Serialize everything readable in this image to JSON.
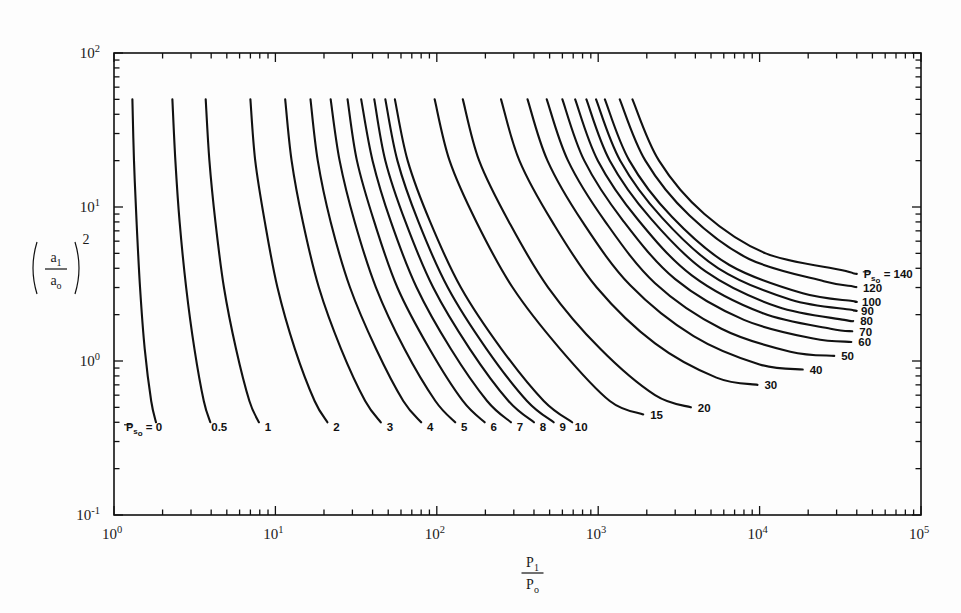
{
  "figure": {
    "background_color": "#fdfdfd",
    "line_color": "#111111",
    "axis_color": "#1a1a1a"
  },
  "chart_data": {
    "type": "line",
    "title": "",
    "subtitle": "",
    "xlabel": "P1/Po",
    "xlabel_numerator": "P",
    "xlabel_numerator_sub": "1",
    "xlabel_denominator": "P",
    "xlabel_denominator_sub": "o",
    "ylabel": "(a1/ao)^2",
    "ylabel_num": "a",
    "ylabel_num_sub": "1",
    "ylabel_den": "a",
    "ylabel_den_sub": "o",
    "ylabel_exponent": "2",
    "xscale": "log",
    "yscale": "log",
    "xlim": [
      1,
      100000
    ],
    "ylim": [
      0.1,
      100
    ],
    "grid": false,
    "legend_position": "inline-curve-labels",
    "x_tick_labels": [
      "10^0",
      "10^1",
      "10^2",
      "10^3",
      "10^4",
      "10^5"
    ],
    "x_tick_mantissas": [
      "10",
      "10",
      "10",
      "10",
      "10",
      "10"
    ],
    "x_tick_exponents": [
      "0",
      "1",
      "2",
      "3",
      "4",
      "5"
    ],
    "y_tick_labels": [
      "10^-1",
      "10^0",
      "10^1",
      "10^2"
    ],
    "y_tick_mantissas": [
      "10",
      "10",
      "10",
      "10"
    ],
    "y_tick_exponents": [
      "-1",
      "0",
      "1",
      "2"
    ],
    "parameter_symbol": "Ps0",
    "parameter_label_left": "P",
    "parameter_label_left_sub": "s",
    "parameter_label_left_sub2": "o",
    "parameter_label_left_value": "= 0",
    "parameter_label_right": "P",
    "parameter_label_right_sub": "s",
    "parameter_label_right_sub2": "o",
    "parameter_label_right_value": "= 140",
    "bottom_curve_labels": [
      "0.5",
      "1",
      "2",
      "3",
      "4",
      "5",
      "6",
      "7",
      "8",
      "9",
      "10"
    ],
    "right_curve_labels": [
      "120",
      "100",
      "90",
      "80",
      "70",
      "60",
      "50",
      "40",
      "30",
      "20",
      "15"
    ],
    "series": [
      {
        "name": "0",
        "x": [
          1.3,
          1.33,
          1.38,
          1.45,
          1.55,
          1.7,
          1.82
        ],
        "y": [
          50.0,
          20.0,
          8.0,
          3.0,
          1.2,
          0.55,
          0.4
        ]
      },
      {
        "name": "0.5",
        "x": [
          2.3,
          2.4,
          2.55,
          2.8,
          3.15,
          3.6,
          3.95
        ],
        "y": [
          50.0,
          20.0,
          8.0,
          3.0,
          1.2,
          0.55,
          0.4
        ]
      },
      {
        "name": "1",
        "x": [
          3.7,
          3.9,
          4.25,
          4.8,
          5.7,
          6.9,
          7.9
        ],
        "y": [
          50.0,
          20.0,
          8.0,
          3.0,
          1.2,
          0.55,
          0.4
        ]
      },
      {
        "name": "2",
        "x": [
          7.0,
          7.5,
          8.6,
          10.3,
          13.2,
          17.5,
          21.0
        ],
        "y": [
          50.0,
          20.0,
          8.0,
          3.0,
          1.2,
          0.55,
          0.4
        ]
      },
      {
        "name": "3",
        "x": [
          11.5,
          12.6,
          14.8,
          18.6,
          25.5,
          36.0,
          45.0
        ],
        "y": [
          50.0,
          20.0,
          8.0,
          3.0,
          1.2,
          0.55,
          0.4
        ]
      },
      {
        "name": "4",
        "x": [
          16.5,
          18.3,
          22.0,
          29.0,
          42.0,
          62.0,
          80.0
        ],
        "y": [
          50.0,
          20.0,
          8.0,
          3.0,
          1.2,
          0.55,
          0.4
        ]
      },
      {
        "name": "5",
        "x": [
          22.0,
          25.0,
          31.0,
          42.0,
          63.0,
          98.0,
          130.0
        ],
        "y": [
          50.0,
          20.0,
          8.0,
          3.0,
          1.2,
          0.55,
          0.4
        ]
      },
      {
        "name": "6",
        "x": [
          28.0,
          32.0,
          41.0,
          57.0,
          90.0,
          145.0,
          198.0
        ],
        "y": [
          50.0,
          20.0,
          8.0,
          3.0,
          1.2,
          0.55,
          0.4
        ]
      },
      {
        "name": "7",
        "x": [
          34.0,
          40.0,
          52.0,
          75.0,
          122.0,
          205.0,
          288.0
        ],
        "y": [
          50.0,
          20.0,
          8.0,
          3.0,
          1.2,
          0.55,
          0.4
        ]
      },
      {
        "name": "8",
        "x": [
          41.0,
          48.0,
          64.0,
          95.0,
          160.0,
          278.0,
          400.0
        ],
        "y": [
          50.0,
          20.0,
          8.0,
          3.0,
          1.2,
          0.55,
          0.4
        ]
      },
      {
        "name": "9",
        "x": [
          48.0,
          57.0,
          77.0,
          117.0,
          203.0,
          362.0,
          530.0
        ],
        "y": [
          50.0,
          20.0,
          8.0,
          3.0,
          1.2,
          0.55,
          0.4
        ]
      },
      {
        "name": "10",
        "x": [
          55.0,
          66.0,
          91.0,
          141.0,
          251.0,
          460.0,
          690.0
        ],
        "y": [
          50.0,
          20.0,
          8.0,
          3.0,
          1.2,
          0.55,
          0.4
        ]
      },
      {
        "name": "15",
        "x": [
          97.0,
          120.0,
          176.0,
          295.0,
          580.0,
          1180.0,
          1900.0
        ],
        "y": [
          50.0,
          20.0,
          8.0,
          3.0,
          1.2,
          0.55,
          0.45
        ]
      },
      {
        "name": "20",
        "x": [
          145.0,
          183.0,
          280.0,
          490.0,
          1030.0,
          2250.0,
          3750.0
        ],
        "y": [
          50.0,
          20.0,
          8.0,
          3.0,
          1.2,
          0.6,
          0.5
        ]
      },
      {
        "name": "30",
        "x": [
          250.0,
          325.0,
          520.0,
          980.0,
          2250.0,
          5400.0,
          9700.0
        ],
        "y": [
          50.0,
          20.0,
          8.0,
          3.0,
          1.3,
          0.78,
          0.7
        ]
      },
      {
        "name": "40",
        "x": [
          365.0,
          485.0,
          800.0,
          1580.0,
          3900.0,
          10000.0,
          18500.0
        ],
        "y": [
          50.0,
          20.0,
          8.0,
          3.1,
          1.45,
          0.95,
          0.88
        ]
      },
      {
        "name": "50",
        "x": [
          480.0,
          650.0,
          1100.0,
          2250.0,
          5800.0,
          15500.0,
          29000.0
        ],
        "y": [
          50.0,
          20.0,
          8.1,
          3.2,
          1.62,
          1.15,
          1.08
        ]
      },
      {
        "name": "60",
        "x": [
          600.0,
          820.0,
          1420.0,
          3000.0,
          8000.0,
          21500.0,
          37000.0
        ],
        "y": [
          50.0,
          20.0,
          8.2,
          3.4,
          1.85,
          1.4,
          1.33
        ]
      },
      {
        "name": "70",
        "x": [
          720.0,
          995.0,
          1760.0,
          3800.0,
          10400.0,
          27500.0,
          37500.0
        ],
        "y": [
          50.0,
          20.0,
          8.3,
          3.6,
          2.05,
          1.62,
          1.56
        ]
      },
      {
        "name": "80",
        "x": [
          845.0,
          1180.0,
          2120.0,
          4650.0,
          12900.0,
          33500.0,
          38000.0
        ],
        "y": [
          50.0,
          20.0,
          8.4,
          3.8,
          2.25,
          1.85,
          1.82
        ]
      },
      {
        "name": "90",
        "x": [
          970.0,
          1370.0,
          2490.0,
          5550.0,
          15600.0,
          37000.0,
          38500.0
        ],
        "y": [
          50.0,
          20.0,
          8.5,
          4.0,
          2.5,
          2.15,
          2.12
        ]
      },
      {
        "name": "100",
        "x": [
          1100.0,
          1560.0,
          2870.0,
          6500.0,
          18500.0,
          37500.0,
          39000.0
        ],
        "y": [
          50.0,
          20.0,
          8.6,
          4.2,
          2.75,
          2.45,
          2.42
        ]
      },
      {
        "name": "120",
        "x": [
          1360.0,
          1960.0,
          3680.0,
          8600.0,
          25000.0,
          38000.0,
          39500.0
        ],
        "y": [
          50.0,
          20.0,
          8.8,
          4.6,
          3.3,
          3.05,
          3.02
        ]
      },
      {
        "name": "140",
        "x": [
          1630.0,
          2380.0,
          4550.0,
          10900.0,
          32000.0,
          38500.0,
          40000.0
        ],
        "y": [
          50.0,
          20.0,
          9.0,
          5.0,
          3.9,
          3.7,
          3.68
        ]
      }
    ]
  }
}
